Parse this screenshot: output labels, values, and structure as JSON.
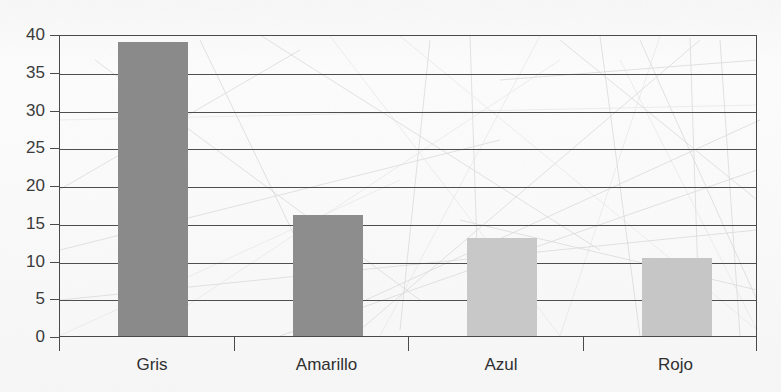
{
  "title_fragment": "·                    ·",
  "chart_data": {
    "type": "bar",
    "title": "",
    "xlabel": "",
    "ylabel": "",
    "categories": [
      "Gris",
      "Amarillo",
      "Azul",
      "Rojo"
    ],
    "values": [
      39,
      16,
      13,
      10.3
    ],
    "bar_colors": [
      "#8a8a8a",
      "#8d8d8d",
      "#c8c8c8",
      "#c6c6c6"
    ],
    "ylim": [
      0,
      40
    ],
    "ytick_labels": [
      "0",
      "5",
      "10",
      "15",
      "20",
      "25",
      "30",
      "35",
      "40"
    ],
    "ytick_values": [
      0,
      5,
      10,
      15,
      20,
      25,
      30,
      35,
      40
    ],
    "grid": true,
    "grid_axis": "y",
    "legend": "none"
  },
  "colors": {
    "axis": "#4a4a4a",
    "gridline": "#4e4e4e",
    "tick_text": "#3b3b3b",
    "category_text": "#2f2f2f",
    "plot_background": "#fbfbfb"
  }
}
